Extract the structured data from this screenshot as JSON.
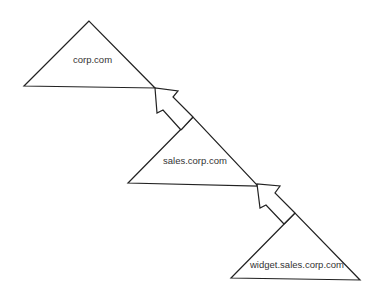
{
  "diagram": {
    "nodes": [
      {
        "id": "corp",
        "label": "corp.com"
      },
      {
        "id": "sales",
        "label": "sales.corp.com"
      },
      {
        "id": "widget",
        "label": "widget.sales.corp.com"
      }
    ],
    "edges": [
      {
        "from": "sales",
        "to": "corp"
      },
      {
        "from": "widget",
        "to": "sales"
      }
    ],
    "colors": {
      "stroke": "#222222",
      "text": "#333333",
      "background": "#ffffff"
    }
  }
}
